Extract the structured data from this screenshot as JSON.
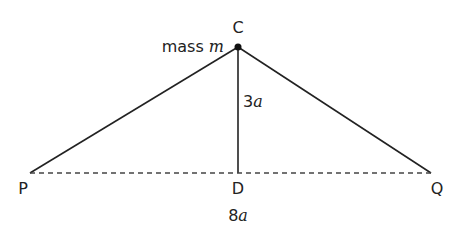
{
  "diagram": {
    "points": {
      "C": {
        "label": "C",
        "x": 238,
        "y": 47
      },
      "P": {
        "label": "P",
        "x": 30,
        "y": 173
      },
      "Q": {
        "label": "Q",
        "x": 431,
        "y": 173
      },
      "D": {
        "label": "D",
        "x": 238,
        "y": 173
      }
    },
    "mass_label_prefix": "mass ",
    "mass_label_symbol": "m",
    "height_label_num": "3",
    "height_label_sym": "a",
    "base_label_num": "8",
    "base_label_sym": "a",
    "line_color": "#222222"
  }
}
